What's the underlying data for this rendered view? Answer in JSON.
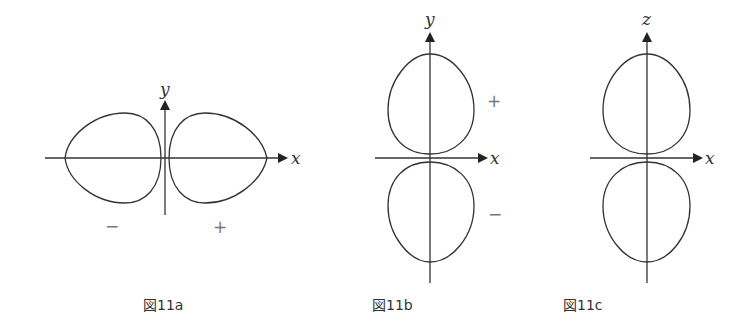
{
  "figures": [
    {
      "id": "11a",
      "caption": "図11a",
      "axis_labels": {
        "horizontal": "x",
        "vertical": "y"
      },
      "lobes": {
        "left_sign": "−",
        "right_sign": "+"
      }
    },
    {
      "id": "11b",
      "caption": "図11b",
      "axis_labels": {
        "horizontal": "x",
        "vertical": "y"
      },
      "lobes": {
        "top_sign": "+",
        "bottom_sign": "−"
      }
    },
    {
      "id": "11c",
      "caption": "図11c",
      "axis_labels": {
        "horizontal": "x",
        "vertical": "z"
      },
      "lobes": {}
    }
  ],
  "colors": {
    "line": "#333333",
    "sign": "#777777",
    "background": "#ffffff"
  }
}
